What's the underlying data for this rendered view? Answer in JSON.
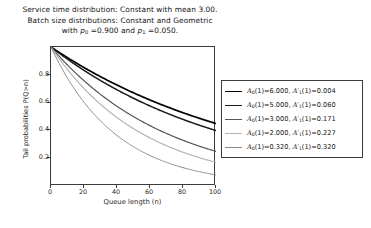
{
  "figure": {
    "background_color": "#ffffff",
    "title_lines": [
      "Service time distribution: Constant with mean 3.00.",
      "Batch size distributions: Constant and Geometric",
      "with p₀ =0.900 and p₁ =0.050."
    ],
    "title_line3_parts": {
      "prefix": "with ",
      "p0_symbol": "p",
      "p0_sub": "0",
      "p0_value": " =0.900 and ",
      "p1_symbol": "p",
      "p1_sub": "1",
      "p1_value": " =0.050."
    }
  },
  "chart_data": {
    "type": "line",
    "title": "Service time distribution: Constant with mean 3.00. Batch size distributions: Constant and Geometric with p0 =0.900 and p1 =0.050.",
    "xlabel": "Queue length (n)",
    "ylabel": "Tail probabilities P(Q>n)",
    "xlim": [
      0,
      100
    ],
    "ylim": [
      0,
      1
    ],
    "xticks": [
      0,
      20,
      40,
      60,
      80,
      100
    ],
    "xtick_labels": [
      "0",
      "20",
      "40",
      "60",
      "80",
      "100"
    ],
    "yticks": [
      0.2,
      0.4,
      0.6,
      0.8
    ],
    "ytick_labels": [
      "0.2",
      "0.4",
      "0.6",
      "0.8"
    ],
    "grid": false,
    "legend_position": "right",
    "series": [
      {
        "name": "A0(1)=6.000, A'1(1)=0.004",
        "color": "#000000",
        "linewidth": 1.7,
        "decay": 0.008,
        "x": [
          0,
          10,
          20,
          30,
          40,
          50,
          60,
          70,
          80,
          90,
          100
        ],
        "values": [
          1.0,
          0.923,
          0.852,
          0.787,
          0.726,
          0.67,
          0.619,
          0.571,
          0.527,
          0.487,
          0.449
        ]
      },
      {
        "name": "A0(1)=5.000, A'1(1)=0.060",
        "color": "#1c1c1c",
        "linewidth": 1.5,
        "decay": 0.0092,
        "x": [
          0,
          10,
          20,
          30,
          40,
          50,
          60,
          70,
          80,
          90,
          100
        ],
        "values": [
          1.0,
          0.912,
          0.832,
          0.759,
          0.692,
          0.631,
          0.576,
          0.525,
          0.479,
          0.437,
          0.398
        ]
      },
      {
        "name": "A0(1)=3.000, A'1(1)=0.171",
        "color": "#565656",
        "linewidth": 1.2,
        "decay": 0.0139,
        "x": [
          0,
          10,
          20,
          30,
          40,
          50,
          60,
          70,
          80,
          90,
          100
        ],
        "values": [
          1.0,
          0.87,
          0.757,
          0.659,
          0.573,
          0.499,
          0.434,
          0.378,
          0.329,
          0.286,
          0.249
        ]
      },
      {
        "name": "A0(1)=2.000, A'1(1)=0.227",
        "color": "#b4b4b4",
        "linewidth": 1.2,
        "decay": 0.0177,
        "x": [
          0,
          10,
          20,
          30,
          40,
          50,
          60,
          70,
          80,
          90,
          100
        ],
        "values": [
          1.0,
          0.838,
          0.702,
          0.588,
          0.493,
          0.413,
          0.346,
          0.29,
          0.243,
          0.203,
          0.17
        ]
      },
      {
        "name": "A0(1)=0.320, A'1(1)=0.320",
        "color": "#8c8c8c",
        "linewidth": 1.0,
        "decay": 0.0253,
        "x": [
          0,
          10,
          20,
          30,
          40,
          50,
          60,
          70,
          80,
          90,
          100
        ],
        "values": [
          1.0,
          0.776,
          0.602,
          0.468,
          0.363,
          0.282,
          0.219,
          0.17,
          0.132,
          0.102,
          0.079
        ]
      }
    ]
  },
  "legend": {
    "entries": [
      {
        "symbol_a": "A",
        "sub_a": "0",
        "text_a": "(1)=6.000,",
        "symbol_b": "A′",
        "sub_b": "1",
        "text_b": "(1)=0.004",
        "color": "#000000",
        "full": "A0(1)=6.000, A'1(1)=0.004"
      },
      {
        "symbol_a": "A",
        "sub_a": "0",
        "text_a": "(1)=5.000,",
        "symbol_b": "A′",
        "sub_b": "1",
        "text_b": "(1)=0.060",
        "color": "#1c1c1c",
        "full": "A0(1)=5.000, A'1(1)=0.060"
      },
      {
        "symbol_a": "A",
        "sub_a": "0",
        "text_a": "(1)=3.000,",
        "symbol_b": "A′",
        "sub_b": "1",
        "text_b": "(1)=0.171",
        "color": "#565656",
        "full": "A0(1)=3.000, A'1(1)=0.171"
      },
      {
        "symbol_a": "A",
        "sub_a": "0",
        "text_a": "(1)=2.000,",
        "symbol_b": "A′",
        "sub_b": "1",
        "text_b": "(1)=0.227",
        "color": "#b4b4b4",
        "full": "A0(1)=2.000, A'1(1)=0.227"
      },
      {
        "symbol_a": "A",
        "sub_a": "0",
        "text_a": "(1)=0.320,",
        "symbol_b": "A′",
        "sub_b": "1",
        "text_b": "(1)=0.320",
        "color": "#8c8c8c",
        "full": "A0(1)=0.320, A'1(1)=0.320"
      }
    ]
  }
}
